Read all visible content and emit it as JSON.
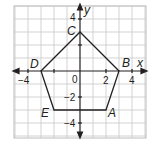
{
  "figure": {
    "type": "coordinate-plane",
    "axes": {
      "x_label": "x",
      "y_label": "y",
      "x_range": [
        -4.5,
        5
      ],
      "y_range": [
        -5,
        5
      ],
      "grid": true,
      "x_ticks": [
        "−4",
        "0",
        "2",
        "4"
      ],
      "y_ticks": [
        "4",
        "−2",
        "−4"
      ]
    },
    "polygon": {
      "name": "pentagon ABCDE",
      "stroke": "#231f20",
      "vertices": [
        {
          "label": "A",
          "x": 2,
          "y": -3
        },
        {
          "label": "B",
          "x": 3,
          "y": 0
        },
        {
          "label": "C",
          "x": 0,
          "y": 3
        },
        {
          "label": "D",
          "x": -3,
          "y": 0
        },
        {
          "label": "E",
          "x": -2,
          "y": -3
        }
      ]
    },
    "colors": {
      "grid": "#c8c8c8",
      "axis": "#231f20",
      "border": "#bdbdbd"
    }
  }
}
